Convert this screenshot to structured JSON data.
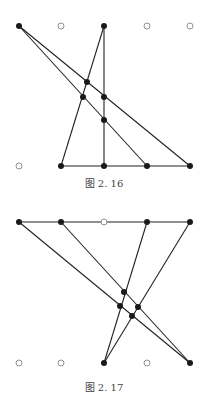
{
  "figures": [
    {
      "caption": "图 2. 16",
      "caption_y": 175,
      "filled": [
        [
          19,
          26
        ],
        [
          104,
          26
        ],
        [
          61,
          166
        ],
        [
          104,
          166
        ],
        [
          147,
          166
        ],
        [
          190,
          166
        ],
        [
          87,
          82
        ],
        [
          83,
          97
        ],
        [
          104,
          97
        ],
        [
          104,
          120
        ]
      ],
      "hollow": [
        [
          61,
          26
        ],
        [
          147,
          26
        ],
        [
          190,
          26
        ],
        [
          19,
          166
        ]
      ],
      "lines": [
        [
          19,
          26,
          190,
          166
        ],
        [
          19,
          26,
          147,
          166
        ],
        [
          104,
          26,
          104,
          166
        ],
        [
          104,
          26,
          61,
          166
        ],
        [
          61,
          166,
          190,
          166
        ]
      ]
    },
    {
      "caption": "图 2. 17",
      "caption_y": 379,
      "filled": [
        [
          19,
          222
        ],
        [
          61,
          222
        ],
        [
          147,
          222
        ],
        [
          190,
          222
        ],
        [
          104,
          363
        ],
        [
          190,
          363
        ],
        [
          124,
          292
        ],
        [
          120,
          306
        ],
        [
          138,
          307
        ],
        [
          132,
          316
        ]
      ],
      "hollow": [
        [
          104,
          222
        ],
        [
          19,
          363
        ],
        [
          61,
          363
        ],
        [
          147,
          363
        ]
      ],
      "lines": [
        [
          19,
          222,
          190,
          222
        ],
        [
          19,
          222,
          190,
          363
        ],
        [
          61,
          222,
          190,
          363
        ],
        [
          147,
          222,
          104,
          363
        ],
        [
          190,
          222,
          104,
          363
        ]
      ]
    }
  ],
  "colors": {
    "line": "#222222",
    "dot": "#1a1a1a",
    "hollow_stroke": "#777777"
  }
}
